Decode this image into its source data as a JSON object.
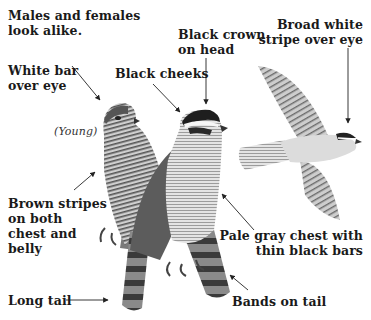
{
  "diagram": {
    "labels": {
      "note": [
        "Males and females",
        "look alike."
      ],
      "white_bar": [
        "White bar",
        "over eye"
      ],
      "black_cheeks": [
        "Black cheeks"
      ],
      "black_crown": [
        "Black crown",
        "on head"
      ],
      "broad_stripe": [
        "Broad white",
        "stripe over eye"
      ],
      "young": "(Young)",
      "brown_stripes": [
        "Brown stripes",
        "on both",
        "chest and",
        "belly"
      ],
      "pale_chest": [
        "Pale gray chest with",
        "thin black bars"
      ],
      "long_tail": "Long tail",
      "bands_tail": "Bands on tail"
    },
    "figures": [
      "juvenile-hawk-perched",
      "adult-hawk-perched",
      "adult-hawk-flying"
    ],
    "colors": {
      "text": "#1a1a1a",
      "arrow": "#222222",
      "plumage_dark": "#3a3a3a",
      "plumage_light": "#d9d9d9"
    }
  }
}
